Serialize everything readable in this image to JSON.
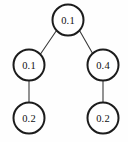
{
  "diagram": {
    "type": "binary-tree",
    "background_color": "#fefefe",
    "node_stroke_color": "#1c1c1c",
    "edge_stroke_color": "#3a3a3a",
    "label_color": "#111111",
    "nodes": [
      {
        "id": "root",
        "label": "0.1",
        "cx": 68,
        "cy": 20,
        "r": 15.5
      },
      {
        "id": "left",
        "label": "0.1",
        "cx": 29,
        "cy": 65,
        "r": 15.5
      },
      {
        "id": "right",
        "label": "0.4",
        "cx": 103,
        "cy": 65,
        "r": 15.5
      },
      {
        "id": "left-leaf",
        "label": "0.2",
        "cx": 29,
        "cy": 118,
        "r": 15.5
      },
      {
        "id": "right-leaf",
        "label": "0.2",
        "cx": 103,
        "cy": 118,
        "r": 15.5
      }
    ],
    "edges": [
      {
        "id": "root-to-left",
        "from": "root",
        "to": "left",
        "x1": 56.5,
        "y1": 30.5,
        "x2": 39.5,
        "y2": 55.5
      },
      {
        "id": "root-to-right",
        "from": "root",
        "to": "right",
        "x1": 79.5,
        "y1": 30.5,
        "x2": 93.5,
        "y2": 55.0
      },
      {
        "id": "left-to-left-leaf",
        "from": "left",
        "to": "left-leaf",
        "x1": 29,
        "y1": 80.5,
        "x2": 29,
        "y2": 102.5
      },
      {
        "id": "right-to-right-leaf",
        "from": "right",
        "to": "right-leaf",
        "x1": 103,
        "y1": 80.5,
        "x2": 103,
        "y2": 102.5
      }
    ]
  }
}
